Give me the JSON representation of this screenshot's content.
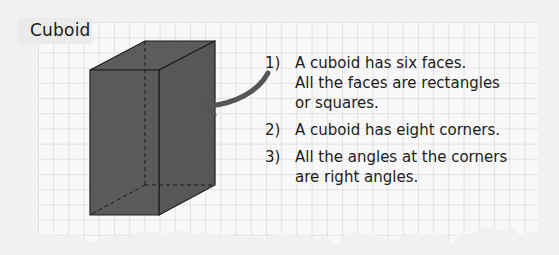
{
  "title": "Cuboid",
  "facts": [
    {
      "number": "1)",
      "lines": [
        "A cuboid has six faces.",
        "All the faces are rectangles",
        "or squares."
      ]
    },
    {
      "number": "2)",
      "lines": [
        "A cuboid has eight corners."
      ]
    },
    {
      "number": "3)",
      "lines": [
        "All the angles at the corners",
        "are right angles."
      ]
    }
  ],
  "colors": {
    "background": "#f1f1f1",
    "paper": "#f8f8f8",
    "grid_line": "#cdcdcd",
    "cuboid_fill": "#5a5a5a",
    "cuboid_edge": "#1e1e1e",
    "arrow": "#555555",
    "text": "#1c1c1c"
  },
  "illustration": {
    "shape": "cuboid",
    "arrow_points_to": "cuboid-right-face"
  }
}
